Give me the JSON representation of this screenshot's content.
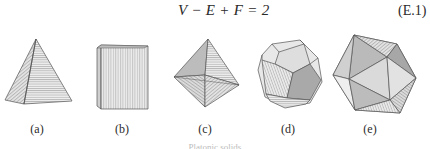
{
  "equation": {
    "formula": "V − E + F = 2",
    "number": "(E.1)"
  },
  "figures": [
    {
      "id": "a",
      "label": "(a)",
      "shape": "tetrahedron-pyramid",
      "label_x": 37
    },
    {
      "id": "b",
      "label": "(b)",
      "shape": "cube",
      "label_x": 122
    },
    {
      "id": "c",
      "label": "(c)",
      "shape": "octahedron",
      "label_x": 205
    },
    {
      "id": "d",
      "label": "(d)",
      "shape": "dodecahedron",
      "label_x": 288
    },
    {
      "id": "e",
      "label": "(e)",
      "shape": "icosahedron",
      "label_x": 370
    }
  ],
  "caption": "Platonic solids",
  "colors": {
    "stroke": "#555555",
    "face_light": "#e6e6e6",
    "face_mid": "#c8c8c8",
    "face_dark": "#a8a8a8",
    "hatch": "#8a8a8a"
  }
}
